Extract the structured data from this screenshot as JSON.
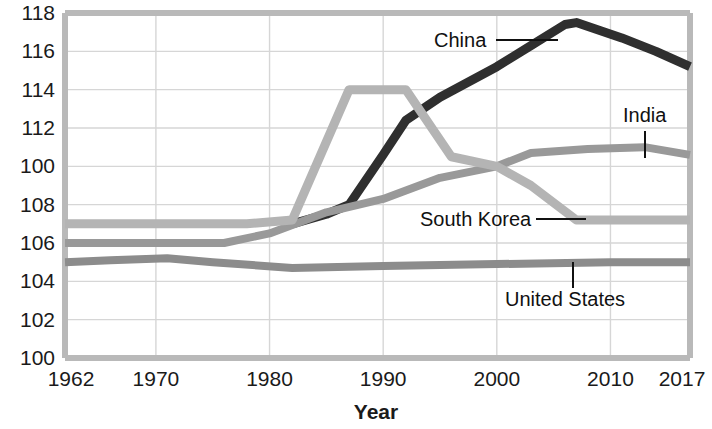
{
  "chart_data": {
    "type": "line",
    "title": "",
    "xlabel": "Year",
    "ylabel": "",
    "grid": true,
    "legend_position": "inline-labels",
    "xlim": [
      1962,
      2017
    ],
    "ylim": [
      100,
      118
    ],
    "x_ticks": [
      "1962",
      "1970",
      "1980",
      "1990",
      "2000",
      "2010",
      "2017"
    ],
    "x_tick_values": [
      1962,
      1970,
      1980,
      1990,
      2000,
      2010,
      2017
    ],
    "y_ticks": [
      "100",
      "102",
      "104",
      "106",
      "108",
      "100",
      "112",
      "114",
      "116",
      "118"
    ],
    "y_tick_values": [
      100,
      102,
      104,
      106,
      108,
      110,
      112,
      114,
      116,
      118
    ],
    "series": [
      {
        "name": "China",
        "color": "#2f2f2f",
        "label": "China",
        "x": [
          1982,
          1985,
          1987,
          1990,
          1992,
          1995,
          2000,
          2003,
          2006,
          2007,
          2011,
          2014,
          2017
        ],
        "values": [
          107.0,
          107.5,
          108.0,
          110.6,
          112.4,
          113.6,
          115.2,
          116.3,
          117.4,
          117.5,
          116.7,
          116.0,
          115.2
        ]
      },
      {
        "name": "India",
        "color": "#999999",
        "label": "India",
        "x": [
          1962,
          1970,
          1976,
          1980,
          1985,
          1990,
          1995,
          2000,
          2003,
          2008,
          2013,
          2017
        ],
        "values": [
          106.0,
          106.0,
          106.0,
          106.5,
          107.6,
          108.3,
          109.4,
          110.0,
          110.7,
          110.9,
          111.0,
          110.6
        ]
      },
      {
        "name": "South Korea",
        "color": "#b4b4b4",
        "label": "South Korea",
        "x": [
          1962,
          1970,
          1978,
          1982,
          1987,
          1992,
          1996,
          2000,
          2003,
          2007,
          2012,
          2017
        ],
        "values": [
          107.0,
          107.0,
          107.0,
          107.2,
          114.0,
          114.0,
          110.5,
          110.0,
          109.0,
          107.2,
          107.2,
          107.2
        ]
      },
      {
        "name": "United States",
        "color": "#8c8c8c",
        "label": "United States",
        "x": [
          1962,
          1966,
          1971,
          1975,
          1982,
          1990,
          2000,
          2010,
          2017
        ],
        "values": [
          105.0,
          105.1,
          105.2,
          105.0,
          104.7,
          104.8,
          104.9,
          105.0,
          105.0
        ]
      }
    ],
    "annotations": [
      {
        "text": "China",
        "series": "China"
      },
      {
        "text": "India",
        "series": "India"
      },
      {
        "text": "South Korea",
        "series": "South Korea"
      },
      {
        "text": "United States",
        "series": "United States"
      }
    ]
  }
}
